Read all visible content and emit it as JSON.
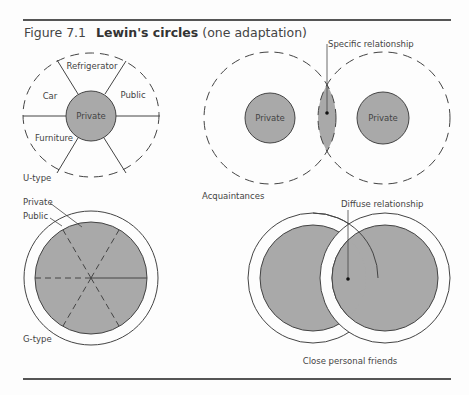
{
  "figure": {
    "number": "Figure 7.1",
    "title_bold": "Lewin's circles",
    "title_suffix": "(one adaptation)"
  },
  "u_type": {
    "label": "U-type",
    "center": "Private",
    "sectors": [
      "Refrigerator",
      "Public",
      "Car",
      "Furniture"
    ]
  },
  "acquaintances": {
    "label": "Acquaintances",
    "left_private": "Private",
    "right_private": "Private",
    "relationship": "Specific relationship"
  },
  "g_type": {
    "label": "G-type",
    "private_label": "Private",
    "public_label": "Public"
  },
  "friends": {
    "label": "Close personal friends",
    "relationship": "Diffuse relationship"
  },
  "colors": {
    "fill": "#a9a9a9",
    "stroke": "#444444",
    "rule": "#555555"
  }
}
